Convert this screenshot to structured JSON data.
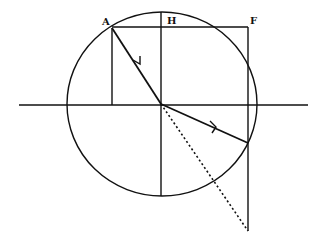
{
  "diagram": {
    "labels": {
      "A": "A",
      "H": "H",
      "F": "F"
    },
    "colors": {
      "stroke": "#111111",
      "background": "#ffffff"
    },
    "geometry": {
      "circle": {
        "cx": 162,
        "cy": 104,
        "rx": 95,
        "ry": 92
      },
      "interface_line": {
        "x1": 19,
        "y1": 105,
        "x2": 308,
        "y2": 105
      },
      "normal_line": {
        "x": 161,
        "y1": 12,
        "y2": 196
      },
      "top_line": {
        "x1": 112,
        "y1": 27,
        "x2": 248,
        "y2": 27
      },
      "point_A": {
        "x": 112,
        "y": 28
      },
      "incident_ray": {
        "from": [
          112,
          28
        ],
        "to": [
          161,
          104
        ]
      },
      "refracted_ray": {
        "from": [
          161,
          104
        ],
        "to": [
          248,
          143
        ]
      },
      "dotted_extension": {
        "from": [
          161,
          104
        ],
        "to": [
          248,
          231
        ]
      },
      "F_vertical": {
        "x": 248,
        "y1": 27,
        "y2": 231
      },
      "A_vertical": {
        "x": 112,
        "y1": 28,
        "y2": 105
      }
    }
  }
}
